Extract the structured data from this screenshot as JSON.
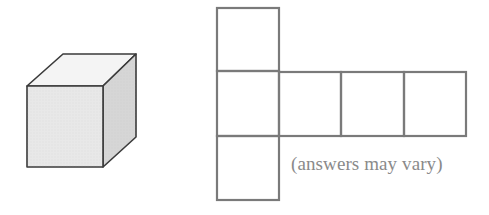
{
  "figure": {
    "cube": {
      "label": "cube",
      "colors": {
        "front": "#e9e9e9",
        "top": "#f4f4f4",
        "right": "#d4d4d4",
        "edge": "#3a3a3a"
      }
    },
    "net": {
      "label": "cube net",
      "faces": 6,
      "layout": "column of 3 squares on the left with a row of 3 squares extending right from the middle square",
      "edge_color": "#7a7a7a"
    },
    "caption": "(answers may vary)"
  }
}
